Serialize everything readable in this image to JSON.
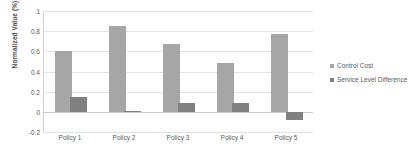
{
  "chart_data": {
    "type": "bar",
    "title": "",
    "xlabel": "",
    "ylabel": "Normalized Value (%)",
    "categories": [
      "Policy 1",
      "Policy 2",
      "Policy 3",
      "Policy 4",
      "Policy 5"
    ],
    "series": [
      {
        "name": "Control Cost",
        "color": "#a6a6a6",
        "values": [
          0.6,
          0.85,
          0.67,
          0.48,
          0.77
        ]
      },
      {
        "name": "Service Level Difference",
        "color": "#808080",
        "values": [
          0.145,
          0.01,
          0.09,
          0.085,
          -0.085
        ]
      }
    ],
    "ylim": [
      -0.2,
      1.0
    ],
    "yticks": [
      1,
      0.8,
      0.6,
      0.4,
      0.2,
      0,
      -0.2
    ],
    "ytick_labels": [
      "1",
      "0.8",
      "0.6",
      "0.4",
      "0.2",
      "0",
      "-0.2"
    ],
    "grid": true,
    "legend_position": "right"
  },
  "colors": {
    "gridline": "#e3e3e3",
    "axis": "#d0d0d0",
    "text": "#5a5a5a",
    "background": "#ffffff"
  }
}
